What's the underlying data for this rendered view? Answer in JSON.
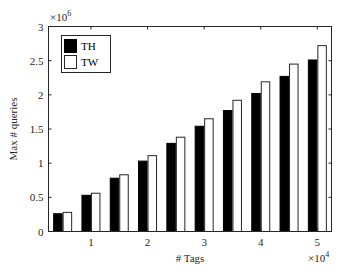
{
  "chart_data": {
    "type": "bar",
    "title": "",
    "xlabel": "# Tags",
    "ylabel": "Max # queries",
    "x_multiplier": "×10^4",
    "y_multiplier": "×10^6",
    "x_exponent_base": "×10",
    "x_exponent_power": "4",
    "y_exponent_base": "×10",
    "y_exponent_power": "6",
    "categories": [
      5000,
      10000,
      15000,
      20000,
      25000,
      30000,
      35000,
      40000,
      45000,
      50000
    ],
    "series": [
      {
        "name": "TH",
        "color": "#000000",
        "values": [
          260000,
          530000,
          780000,
          1030000,
          1290000,
          1540000,
          1770000,
          2020000,
          2270000,
          2510000
        ]
      },
      {
        "name": "TW",
        "color": "#ffffff",
        "values": [
          280000,
          560000,
          830000,
          1110000,
          1380000,
          1650000,
          1920000,
          2190000,
          2450000,
          2720000
        ]
      }
    ],
    "xlim": [
      2500,
      52500
    ],
    "ylim": [
      0,
      3000000
    ],
    "xticks": [
      10000,
      20000,
      30000,
      40000,
      50000
    ],
    "xtick_labels": [
      "1",
      "2",
      "3",
      "4",
      "5"
    ],
    "yticks": [
      0,
      500000,
      1000000,
      1500000,
      2000000,
      2500000,
      3000000
    ],
    "ytick_labels": [
      "0",
      "0.5",
      "1",
      "1.5",
      "2",
      "2.5",
      "3"
    ],
    "grid": false,
    "legend_position": "upper-left"
  }
}
